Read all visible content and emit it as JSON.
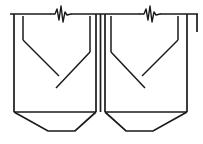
{
  "figure": {
    "background_color": "#ffffff",
    "line_color": "#1a1a1a",
    "canvas": {
      "width": 203,
      "height": 144
    },
    "units": "pixels"
  },
  "geometry": {
    "top_rail": {
      "label": "top rail",
      "y": 14,
      "segments": [
        {
          "name": "rail-left",
          "x1": 10,
          "x2": 51
        },
        {
          "name": "rail-middle",
          "x1": 71,
          "x2": 140
        },
        {
          "name": "rail-right",
          "x1": 160,
          "x2": 198
        }
      ]
    },
    "break_symbols": [
      {
        "name": "break-symbol-left",
        "center_x": 61,
        "baseline_y": 14,
        "points": "51,14 55,14 57,9 59,20 61,6 63,22 65,12 67,15 71,14"
      },
      {
        "name": "break-symbol-right",
        "center_x": 150,
        "baseline_y": 14,
        "points": "140,14 144,14 146,9 148,20 150,6 152,22 154,12 156,15 160,14"
      }
    ],
    "left_hopper": {
      "name": "left-hopper",
      "outer_outline": "14,14 14,112 48,131 75,131 96,112 96,14",
      "vertical_left_outer": {
        "x": 14,
        "y1": 14,
        "y2": 112
      },
      "vertical_right_outer": {
        "x": 96,
        "y1": 14,
        "y2": 112
      },
      "bottom_rail": {
        "y": 112,
        "x1": 14,
        "x2": 96
      },
      "bottom_chamfer_left": "14,112 48,131",
      "bottom_flat": "48,131 75,131",
      "bottom_chamfer_right": "75,131 96,112",
      "inner_left_wall": {
        "x": 23,
        "y1": 16,
        "y2": 40
      },
      "inner_vee_left": "23,40 59,76",
      "inner_vee_right": "56,88 90,52",
      "inner_right_wall": {
        "x": 90,
        "y1": 16,
        "y2": 52
      },
      "vee_gap": {
        "from": "59,76",
        "to": "56,88",
        "note": "open vertex, strokes do not meet"
      }
    },
    "right_hopper": {
      "name": "right-hopper",
      "outer_outline": "105,14 105,112 126,131 153,131 187,112 187,14",
      "vertical_left_outer": {
        "x": 105,
        "y1": 14,
        "y2": 112
      },
      "vertical_right_outer": {
        "x": 187,
        "y1": 14,
        "y2": 112
      },
      "bottom_rail": {
        "y": 112,
        "x1": 105,
        "x2": 187
      },
      "bottom_chamfer_left": "105,112 126,131",
      "bottom_flat": "126,131 153,131",
      "bottom_chamfer_right": "153,131 187,112",
      "inner_left_wall": {
        "x": 111,
        "y1": 16,
        "y2": 52
      },
      "inner_vee_left": "111,52 145,88",
      "inner_vee_right": "142,76 178,40",
      "inner_right_wall": {
        "x": 178,
        "y1": 16,
        "y2": 40
      },
      "vee_gap": {
        "from": "145,88",
        "to": "142,76",
        "note": "open vertex, strokes do not meet"
      }
    },
    "center_divider": {
      "name": "center-divider",
      "x": 100.5,
      "y1": 14,
      "y2": 112,
      "note": "shared vertical between the two hoppers, ends at the Y junction"
    },
    "right_edge_stub": {
      "name": "right-edge-stub",
      "x": 197,
      "y1": 14,
      "y2": 32
    }
  },
  "annotations": {
    "break_symbol_meaning": "break / discontinuity",
    "stroke_weight_main": 1.7,
    "stroke_weight_thin": 1.5
  }
}
